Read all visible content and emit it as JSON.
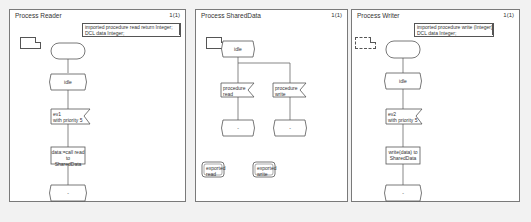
{
  "frames": [
    {
      "title": "Process Reader",
      "page": "1(1)",
      "declaration": [
        "imported procedure read return Integer;",
        "DCL data Integer;"
      ],
      "state_idle": "idle",
      "input": [
        "ev1",
        "with priority 5"
      ],
      "task": [
        "data:=call read to",
        "SharedData"
      ],
      "next_state": "-"
    },
    {
      "title": "Process SharedData",
      "page": "1(1)",
      "state_idle": "idle",
      "inputs": [
        {
          "line1": "procedure",
          "line2": "read"
        },
        {
          "line1": "procedure",
          "line2": "write"
        }
      ],
      "next_states": [
        "-",
        "-"
      ],
      "exports": [
        {
          "line1": "exported",
          "line2": "read"
        },
        {
          "line1": "exported",
          "line2": "write"
        }
      ]
    },
    {
      "title": "Process Writer",
      "page": "1(1)",
      "declaration": [
        "imported procedure write (Integer);",
        "DCL data Integer;"
      ],
      "state_idle": "idle",
      "input": [
        "ev2",
        "with priority 5"
      ],
      "task": [
        "write(data) to",
        "SharedData"
      ],
      "next_state": "-"
    }
  ]
}
